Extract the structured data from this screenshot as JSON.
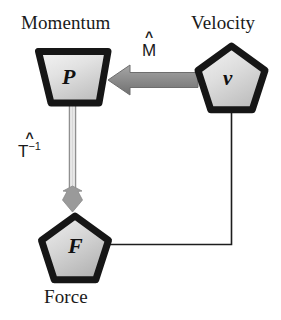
{
  "diagram": {
    "background_color": "#ffffff",
    "node_border_color": "#161616",
    "node_fill_light": "#f0f0f0",
    "node_fill_dark": "#b8b8b8",
    "thick_arrow_color": "#8c8c8c",
    "thin_line_color": "#1a1a1a",
    "nodes": [
      {
        "id": "momentum",
        "shape": "trapezoid",
        "glyph": "P",
        "label": "Momentum",
        "label_position": "above"
      },
      {
        "id": "velocity",
        "shape": "pentagon",
        "glyph": "v",
        "label": "Velocity",
        "label_position": "above"
      },
      {
        "id": "force",
        "shape": "pentagon",
        "glyph": "F",
        "label": "Force",
        "label_position": "below"
      }
    ],
    "edges": [
      {
        "id": "velocity-to-momentum",
        "from": "velocity",
        "to": "momentum",
        "style": "thick-filled-arrow",
        "direction": "left",
        "label_base": "M",
        "label_hat": "^",
        "label_exponent": ""
      },
      {
        "id": "momentum-to-force",
        "from": "momentum",
        "to": "force",
        "style": "thin-double-line-arrow",
        "direction": "down",
        "label_base": "T",
        "label_hat": "^",
        "label_exponent": "−1"
      },
      {
        "id": "force-to-velocity",
        "from": "force",
        "to": "velocity",
        "style": "thin-elbow-line",
        "direction": "none",
        "label_base": "",
        "label_hat": "",
        "label_exponent": ""
      }
    ]
  }
}
